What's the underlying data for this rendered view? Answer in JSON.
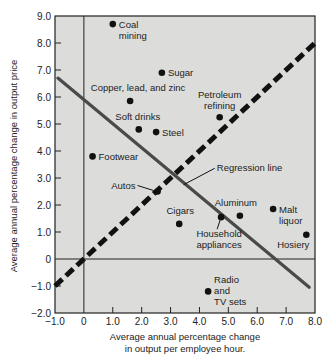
{
  "chart_data": {
    "type": "scatter",
    "title": "",
    "xlabel": [
      "Average annual percentage change",
      "in output per employee hour."
    ],
    "ylabel": "Average annual percentage change in output price",
    "xlim": [
      -1.0,
      8.0
    ],
    "ylim": [
      -2.0,
      9.0
    ],
    "xticks": [
      -1.0,
      0,
      1.0,
      2.0,
      3.0,
      4.0,
      5.0,
      6.0,
      7.0,
      8.0
    ],
    "xtick_labels": [
      "−1.0",
      "0",
      "1.0",
      "2.0",
      "3.0",
      "4.0",
      "5.0",
      "6.0",
      "7.0",
      "8.0"
    ],
    "yticks": [
      -2.0,
      -1.0,
      0,
      1.0,
      2.0,
      3.0,
      4.0,
      5.0,
      6.0,
      7.0,
      8.0,
      9.0
    ],
    "ytick_labels": [
      "−2.0",
      "−1.0",
      "0",
      "1.0",
      "2.0",
      "3.0",
      "4.0",
      "5.0",
      "6.0",
      "7.0",
      "8.0",
      "9.0"
    ],
    "grid": false,
    "background": "#dcdcda",
    "points": [
      {
        "name": "Coal mining",
        "lines": [
          "Coal",
          "mining"
        ],
        "x": 1.0,
        "y": 8.7,
        "label_pos": "right"
      },
      {
        "name": "Sugar",
        "lines": [
          "Sugar"
        ],
        "x": 2.7,
        "y": 6.9,
        "label_pos": "right"
      },
      {
        "name": "Copper, lead, and zinc",
        "lines": [
          "Copper, lead, and zinc"
        ],
        "x": 1.6,
        "y": 5.85,
        "label_pos": "above"
      },
      {
        "name": "Soft drinks",
        "lines": [
          "Soft drinks"
        ],
        "x": 1.9,
        "y": 4.8,
        "label_pos": "above"
      },
      {
        "name": "Steel",
        "lines": [
          "Steel"
        ],
        "x": 2.5,
        "y": 4.7,
        "label_pos": "right"
      },
      {
        "name": "Petroleum refining",
        "lines": [
          "Petroleum",
          "refining"
        ],
        "x": 4.7,
        "y": 5.25,
        "label_pos": "above"
      },
      {
        "name": "Footwear",
        "lines": [
          "Footwear"
        ],
        "x": 0.3,
        "y": 3.8,
        "label_pos": "right"
      },
      {
        "name": "Autos",
        "lines": [
          "Autos"
        ],
        "x": 2.55,
        "y": 2.5,
        "label_pos": "left-arrow"
      },
      {
        "name": "Cigars",
        "lines": [
          "Cigars"
        ],
        "x": 3.3,
        "y": 1.3,
        "label_pos": "above"
      },
      {
        "name": "Household appliances",
        "lines": [
          "Household",
          "appliances"
        ],
        "x": 4.75,
        "y": 1.55,
        "label_pos": "below-arrow"
      },
      {
        "name": "Aluminum",
        "lines": [
          "Aluminum"
        ],
        "x": 5.4,
        "y": 1.6,
        "label_pos": "above"
      },
      {
        "name": "Malt liquor",
        "lines": [
          "Malt",
          "liquor"
        ],
        "x": 6.55,
        "y": 1.85,
        "label_pos": "right"
      },
      {
        "name": "Hosiery",
        "lines": [
          "Hosiery"
        ],
        "x": 7.7,
        "y": 0.9,
        "label_pos": "below-left"
      },
      {
        "name": "Radio and TV sets",
        "lines": [
          "Radio",
          "and",
          "TV sets"
        ],
        "x": 4.3,
        "y": -1.2,
        "label_pos": "right"
      }
    ],
    "lines": [
      {
        "name": "Regression line",
        "style": "solid",
        "color": "#4a4a4a",
        "x": [
          -0.9,
          7.8
        ],
        "y": [
          6.7,
          -1.05
        ],
        "label": "Regression line"
      },
      {
        "name": "45-degree line",
        "style": "dashed",
        "color": "#111111",
        "x": [
          -1.0,
          8.0
        ],
        "y": [
          -1.0,
          8.0
        ]
      }
    ],
    "reference_lines": {
      "x0": 0,
      "y0": 0
    }
  }
}
